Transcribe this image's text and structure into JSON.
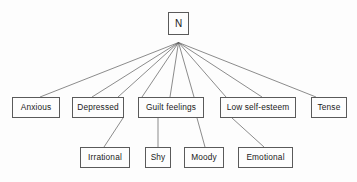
{
  "diagram": {
    "type": "hierarchy-tree",
    "background_color": "#fdfdfd",
    "line_color": "#5a5a5a",
    "text_color": "#1a1a1a",
    "root": {
      "id": "root-n",
      "label": "N",
      "x": 168,
      "y": 12,
      "w": 21,
      "h": 23
    },
    "hub": {
      "x": 178.5,
      "y": 42.5
    },
    "level2": [
      {
        "id": "anxious",
        "label": "Anxious",
        "x": 12,
        "y": 97,
        "w": 48,
        "h": 21
      },
      {
        "id": "depressed",
        "label": "Depressed",
        "x": 72,
        "y": 97,
        "w": 52,
        "h": 21
      },
      {
        "id": "guilt-feelings",
        "label": "Guilt  feelings",
        "x": 138,
        "y": 97,
        "w": 66,
        "h": 21
      },
      {
        "id": "low-self-esteem",
        "label": "Low self-esteem",
        "x": 220,
        "y": 97,
        "w": 76,
        "h": 21
      },
      {
        "id": "tense",
        "label": "Tense",
        "x": 311,
        "y": 97,
        "w": 36,
        "h": 21
      }
    ],
    "level3": [
      {
        "id": "irrational",
        "label": "Irrational",
        "x": 80,
        "y": 147,
        "w": 50,
        "h": 21
      },
      {
        "id": "shy",
        "label": "Shy",
        "x": 145,
        "y": 147,
        "w": 26,
        "h": 21
      },
      {
        "id": "moody",
        "label": "Moody",
        "x": 184,
        "y": 147,
        "w": 40,
        "h": 21
      },
      {
        "id": "emotional",
        "label": "Emotional",
        "x": 238,
        "y": 147,
        "w": 55,
        "h": 21
      }
    ],
    "edges": [
      {
        "from": "hub",
        "to": "anxious",
        "x1": 178.5,
        "y1": 42.5,
        "x2": 40,
        "y2": 97
      },
      {
        "from": "hub",
        "to": "depressed-left",
        "x1": 178.5,
        "y1": 42.5,
        "x2": 92,
        "y2": 97
      },
      {
        "from": "hub",
        "to": "depressed-right",
        "x1": 178.5,
        "y1": 42.5,
        "x2": 118,
        "y2": 97
      },
      {
        "from": "hub",
        "to": "guilt-left",
        "x1": 178.5,
        "y1": 42.5,
        "x2": 142,
        "y2": 97
      },
      {
        "from": "hub",
        "to": "guilt-mid",
        "x1": 178.5,
        "y1": 42.5,
        "x2": 170,
        "y2": 97
      },
      {
        "from": "hub",
        "to": "guilt-right",
        "x1": 178.5,
        "y1": 42.5,
        "x2": 194,
        "y2": 97
      },
      {
        "from": "hub",
        "to": "lowself-left",
        "x1": 178.5,
        "y1": 42.5,
        "x2": 226,
        "y2": 97
      },
      {
        "from": "hub",
        "to": "lowself-right",
        "x1": 178.5,
        "y1": 42.5,
        "x2": 262,
        "y2": 97
      },
      {
        "from": "hub",
        "to": "tense",
        "x1": 178.5,
        "y1": 42.5,
        "x2": 316,
        "y2": 97
      },
      {
        "from": "depressed",
        "to": "irrational",
        "x1": 123,
        "y1": 118,
        "x2": 104,
        "y2": 147
      },
      {
        "from": "guilt-feelings",
        "to": "shy",
        "x1": 158,
        "y1": 118,
        "x2": 158,
        "y2": 147
      },
      {
        "from": "guilt-feelings",
        "to": "moody",
        "x1": 197,
        "y1": 118,
        "x2": 205,
        "y2": 147
      },
      {
        "from": "low-self-esteem",
        "to": "emotional",
        "x1": 232,
        "y1": 118,
        "x2": 264,
        "y2": 147
      }
    ]
  }
}
